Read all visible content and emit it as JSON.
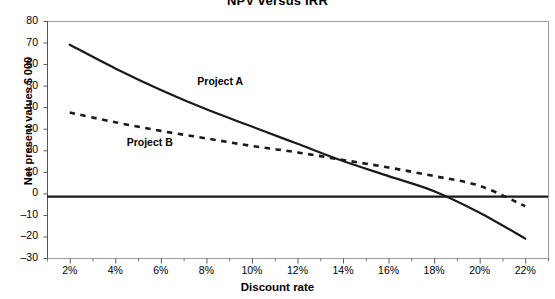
{
  "chart_data": {
    "type": "line",
    "title": "NPV versus IRR",
    "xlabel": "Discount rate",
    "ylabel": "Net present values $ 000",
    "x": [
      2,
      4,
      6,
      8,
      10,
      12,
      14,
      16,
      18,
      20,
      22
    ],
    "xticklabels": [
      "2%",
      "4%",
      "6%",
      "8%",
      "10%",
      "12%",
      "14%",
      "16%",
      "18%",
      "20%",
      "22%"
    ],
    "yticklabels": [
      "80",
      "70",
      "60",
      "50",
      "40",
      "30",
      "20",
      "10",
      "0",
      "–10",
      "–20",
      "–30"
    ],
    "xlim": [
      1,
      23
    ],
    "ylim": [
      -30,
      80
    ],
    "grid": false,
    "legend": "inline-annotations",
    "zero_reference_line": -1.5,
    "series": [
      {
        "name": "Project A",
        "style": "solid",
        "color": "#1a1a1a",
        "values": [
          69,
          58,
          48,
          39,
          31,
          23,
          15,
          8,
          1,
          -9,
          -21
        ],
        "label_x": 7.6,
        "label_y": 52,
        "irr_percent": 16.2
      },
      {
        "name": "Project B",
        "style": "dashed",
        "color": "#1a1a1a",
        "values": [
          37.5,
          33,
          29,
          25.5,
          22,
          19,
          15.5,
          12,
          8,
          3.5,
          -6
        ],
        "label_x": 4.5,
        "label_y": 24,
        "irr_percent": 20.4
      }
    ]
  }
}
